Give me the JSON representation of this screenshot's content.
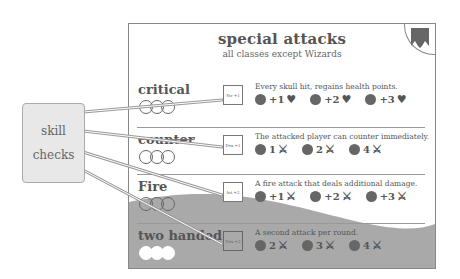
{
  "card": {
    "title": "special attacks",
    "subtitle": "all classes except Wizards",
    "banner_icon": "banner-icon",
    "attacks": [
      {
        "name": "critical",
        "stat_label": "Str +1",
        "description": "Every skull hit, regains health points.",
        "bonuses": [
          {
            "value": "+1",
            "icon": "heart-icon",
            "glyph": "♥"
          },
          {
            "value": "+2",
            "icon": "heart-icon",
            "glyph": "♥"
          },
          {
            "value": "+3",
            "icon": "heart-icon",
            "glyph": "♥"
          }
        ],
        "circles_filled": 0
      },
      {
        "name": "counter",
        "stat_label": "Dex +1",
        "description": "The attacked player can counter immediately.",
        "bonuses": [
          {
            "value": "1",
            "icon": "sword-icon",
            "glyph": "⚔"
          },
          {
            "value": "2",
            "icon": "sword-icon",
            "glyph": "⚔"
          },
          {
            "value": "4",
            "icon": "sword-icon",
            "glyph": "⚔"
          }
        ],
        "circles_filled": 0
      },
      {
        "name": "Fire",
        "stat_label": "Int +2",
        "description": "A fire attack that deals additional damage.",
        "bonuses": [
          {
            "value": "+1",
            "icon": "sword-icon",
            "glyph": "⚔"
          },
          {
            "value": "+2",
            "icon": "sword-icon",
            "glyph": "⚔"
          },
          {
            "value": "+3",
            "icon": "sword-icon",
            "glyph": "⚔"
          }
        ],
        "circles_filled": 0
      },
      {
        "name": "two handed",
        "stat_label": "Dex +2",
        "description": "A second attack per round.",
        "bonuses": [
          {
            "value": "2",
            "icon": "sword-icon",
            "glyph": "⚔"
          },
          {
            "value": "3",
            "icon": "sword-icon",
            "glyph": "⚔"
          },
          {
            "value": "4",
            "icon": "sword-icon",
            "glyph": "⚔"
          }
        ],
        "circles_filled": 3
      }
    ]
  },
  "callout": {
    "line1": "skill",
    "line2": "checks"
  },
  "colors": {
    "card_border": "#888888",
    "wave_fill": "#aaaaaa",
    "die_fill": "#666666",
    "callout_bg": "#e8e8e8"
  }
}
